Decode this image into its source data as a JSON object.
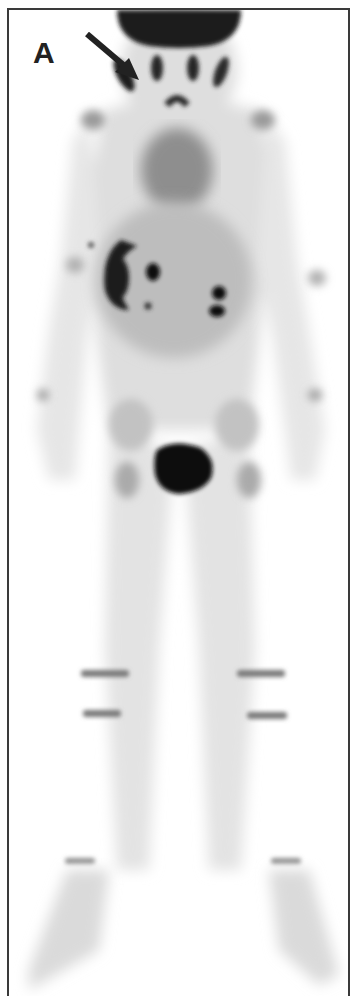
{
  "figure": {
    "panel_label": "A",
    "annotations": [
      {
        "type": "arrow",
        "direction": "down-right",
        "target": "facial/maxillary region uptake"
      }
    ],
    "findings": [
      {
        "region": "skull/face",
        "intensity": "high"
      },
      {
        "region": "right abdomen (C-shaped)",
        "intensity": "high"
      },
      {
        "region": "kidneys",
        "intensity": "high"
      },
      {
        "region": "bladder",
        "intensity": "very high"
      },
      {
        "region": "knee growth plates",
        "intensity": "moderate"
      },
      {
        "region": "ankle growth plates",
        "intensity": "moderate"
      }
    ],
    "colors": {
      "background": "#ffffff",
      "border": "#3a3a3a",
      "hot_uptake": "#141414",
      "body_soft": "#d6d6d6"
    }
  }
}
